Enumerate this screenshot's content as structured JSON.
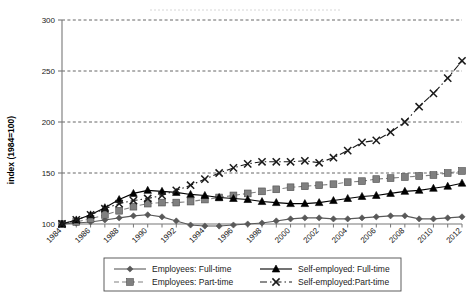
{
  "chart_data": {
    "type": "line",
    "title": "",
    "xlabel": "",
    "ylabel": "index (1984=100)",
    "ylim": [
      100,
      300
    ],
    "yticks": [
      100,
      150,
      200,
      250,
      300
    ],
    "grid": true,
    "legend_position": "bottom",
    "x": [
      1984,
      1985,
      1986,
      1987,
      1988,
      1989,
      1990,
      1991,
      1992,
      1993,
      1994,
      1995,
      1996,
      1997,
      1998,
      1999,
      2000,
      2001,
      2002,
      2003,
      2004,
      2005,
      2006,
      2007,
      2008,
      2009,
      2010,
      2011,
      2012
    ],
    "xtick_labels": [
      "1984",
      "1986",
      "1988",
      "1990",
      "1992",
      "1994",
      "1996",
      "1998",
      "2000",
      "2002",
      "2004",
      "2006",
      "2008",
      "2010",
      "2012"
    ],
    "series": [
      {
        "name": "Employees: Full-time",
        "marker": "diamond",
        "linestyle": "solid",
        "color": "#595959",
        "values": [
          100,
          101,
          102,
          104,
          106,
          108,
          109,
          107,
          103,
          99,
          98,
          98,
          99,
          100,
          101,
          103,
          105,
          106,
          106,
          105,
          105,
          106,
          107,
          108,
          108,
          105,
          105,
          106,
          107
        ]
      },
      {
        "name": "Employees: Part-time",
        "marker": "square",
        "linestyle": "dashed",
        "color": "#808080",
        "values": [
          100,
          102,
          105,
          109,
          113,
          117,
          120,
          121,
          121,
          122,
          124,
          126,
          128,
          130,
          132,
          134,
          136,
          137,
          138,
          139,
          141,
          142,
          144,
          145,
          146,
          147,
          148,
          150,
          152
        ]
      },
      {
        "name": "Self-employed: Full-time",
        "marker": "triangle",
        "linestyle": "solid",
        "color": "#000000",
        "values": [
          100,
          104,
          109,
          116,
          124,
          130,
          133,
          132,
          131,
          129,
          128,
          126,
          125,
          124,
          122,
          121,
          120,
          120,
          121,
          123,
          125,
          127,
          128,
          130,
          132,
          133,
          135,
          137,
          140
        ]
      },
      {
        "name": "Self-employed:Part-time",
        "marker": "x",
        "linestyle": "dashdot",
        "color": "#1a1a1a",
        "values": [
          100,
          104,
          109,
          115,
          120,
          123,
          125,
          128,
          133,
          138,
          144,
          150,
          155,
          159,
          161,
          161,
          161,
          162,
          160,
          165,
          172,
          180,
          182,
          190,
          200,
          215,
          228,
          243,
          260
        ]
      }
    ]
  },
  "axis": {
    "y_tick_labels": [
      "100",
      "150",
      "200",
      "250",
      "300"
    ]
  },
  "legend": {
    "items": [
      {
        "label": "Employees: Full-time"
      },
      {
        "label": "Self-employed: Full-time"
      },
      {
        "label": "Employees: Part-time"
      },
      {
        "label": "Self-employed:Part-time"
      }
    ]
  }
}
